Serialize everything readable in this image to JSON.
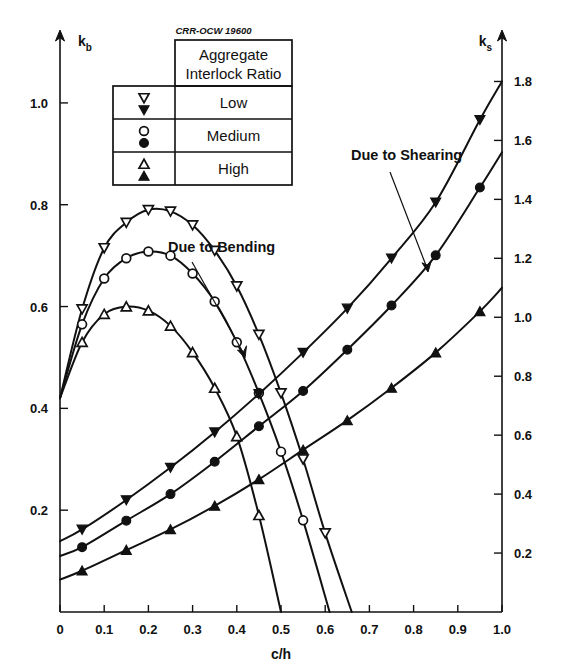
{
  "figure": {
    "code_label": "CRR-OCW 19600",
    "left_axis_name": "k",
    "left_axis_sub": "b",
    "right_axis_name": "k",
    "right_axis_sub": "s",
    "x_axis_label": "c/h"
  },
  "legend": {
    "title_line1": "Aggregate",
    "title_line2": "Interlock Ratio",
    "rows": [
      {
        "label": "Low",
        "open_symbol": "inverted-triangle-open",
        "filled_symbol": "inverted-triangle-filled"
      },
      {
        "label": "Medium",
        "open_symbol": "circle-open",
        "filled_symbol": "circle-filled"
      },
      {
        "label": "High",
        "open_symbol": "triangle-open",
        "filled_symbol": "triangle-filled"
      }
    ]
  },
  "annotations": [
    {
      "text": "Due to Bending"
    },
    {
      "text": "Due to Shearing"
    }
  ],
  "chart_data": {
    "type": "line",
    "title": "",
    "xlabel": "c/h",
    "ylabel": "k_b",
    "y2label": "k_s",
    "xlim": [
      0,
      1.0
    ],
    "ylim": [
      0,
      1.1
    ],
    "y2lim": [
      0,
      1.9
    ],
    "grid": false,
    "legend_position": "top-center",
    "x_ticks": [
      0,
      0.1,
      0.2,
      0.3,
      0.4,
      0.5,
      0.6,
      0.7,
      0.8,
      0.9,
      1.0
    ],
    "x_ticklabels": [
      "0",
      "0.1",
      "0.2",
      "0.3",
      "0.4",
      "0.5",
      "0.6",
      "0.7",
      "0.8",
      "0.9",
      "1.0"
    ],
    "y_ticks": [
      0.2,
      0.4,
      0.6,
      0.8,
      1.0
    ],
    "y_ticklabels": [
      "0.2",
      "0.4",
      "0.6",
      "0.8",
      "1.0"
    ],
    "y2_ticks": [
      0.2,
      0.4,
      0.6,
      0.8,
      1.0,
      1.2,
      1.4,
      1.6,
      1.8
    ],
    "y2_ticklabels": [
      "0.2",
      "0.4",
      "0.6",
      "0.8",
      "1.0",
      "1.2",
      "1.4",
      "1.6",
      "1.8"
    ],
    "series": [
      {
        "name": "Bending - Low",
        "axis": "left",
        "marker": "inverted-triangle-open",
        "x": [
          0.0,
          0.05,
          0.1,
          0.15,
          0.2,
          0.25,
          0.3,
          0.35,
          0.4,
          0.45,
          0.5,
          0.55,
          0.6,
          0.66
        ],
        "values": [
          0.42,
          0.595,
          0.715,
          0.765,
          0.79,
          0.787,
          0.76,
          0.71,
          0.64,
          0.545,
          0.43,
          0.3,
          0.155,
          0.0
        ]
      },
      {
        "name": "Bending - Medium",
        "axis": "left",
        "marker": "circle-open",
        "x": [
          0.0,
          0.05,
          0.1,
          0.15,
          0.2,
          0.25,
          0.3,
          0.35,
          0.4,
          0.45,
          0.5,
          0.55,
          0.61
        ],
        "values": [
          0.42,
          0.565,
          0.655,
          0.695,
          0.708,
          0.7,
          0.665,
          0.61,
          0.53,
          0.43,
          0.315,
          0.18,
          0.0
        ]
      },
      {
        "name": "Bending - High",
        "axis": "left",
        "marker": "triangle-open",
        "x": [
          0.0,
          0.05,
          0.1,
          0.15,
          0.2,
          0.25,
          0.3,
          0.35,
          0.4,
          0.45,
          0.5
        ],
        "values": [
          0.42,
          0.53,
          0.585,
          0.6,
          0.592,
          0.562,
          0.51,
          0.44,
          0.345,
          0.19,
          0.0
        ]
      },
      {
        "name": "Shearing - Low",
        "axis": "right",
        "marker": "inverted-triangle-filled",
        "x": [
          0.0,
          0.05,
          0.15,
          0.25,
          0.35,
          0.45,
          0.55,
          0.65,
          0.75,
          0.85,
          0.95,
          1.0
        ],
        "values": [
          0.24,
          0.28,
          0.38,
          0.49,
          0.61,
          0.74,
          0.88,
          1.03,
          1.2,
          1.39,
          1.67,
          1.8
        ]
      },
      {
        "name": "Shearing - Medium",
        "axis": "right",
        "marker": "circle-filled",
        "x": [
          0.0,
          0.05,
          0.15,
          0.25,
          0.35,
          0.45,
          0.55,
          0.65,
          0.75,
          0.85,
          0.95,
          1.0
        ],
        "values": [
          0.19,
          0.22,
          0.31,
          0.4,
          0.51,
          0.63,
          0.75,
          0.89,
          1.04,
          1.21,
          1.44,
          1.56
        ]
      },
      {
        "name": "Shearing - High",
        "axis": "right",
        "marker": "triangle-filled",
        "x": [
          0.0,
          0.05,
          0.15,
          0.25,
          0.35,
          0.45,
          0.55,
          0.65,
          0.75,
          0.85,
          0.95,
          1.0
        ],
        "values": [
          0.11,
          0.14,
          0.21,
          0.28,
          0.36,
          0.45,
          0.55,
          0.65,
          0.76,
          0.88,
          1.02,
          1.1
        ]
      }
    ]
  }
}
